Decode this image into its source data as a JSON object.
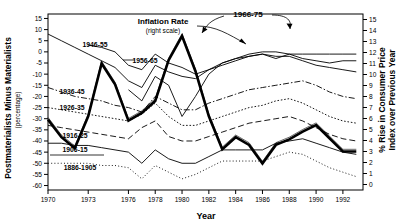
{
  "chart_data": {
    "type": "line",
    "title": "",
    "xlabel": "Year",
    "ylabel": "Postmaterialists Minus Materialists (percentage)",
    "ylabel_sub": "(percentage)",
    "y2label": "% Rise in Consumer Price Index over Previous Year",
    "grid": false,
    "legend_position": "inline-annotations",
    "xlim": [
      1970,
      1993.5
    ],
    "ylim": [
      -62,
      17
    ],
    "y2lim": [
      15.5,
      -0.5
    ],
    "x_ticks": [
      1970,
      1973,
      1976,
      1978,
      1980,
      1982,
      1984,
      1986,
      1988,
      1990,
      1992
    ],
    "x_tick_labels": [
      "1970",
      "1973",
      "1976",
      "1978",
      "1980",
      "1982",
      "1984",
      "1986",
      "1988",
      "1990",
      "1992"
    ],
    "y_ticks": [
      15,
      10,
      5,
      0,
      -5,
      -10,
      -15,
      -20,
      -25,
      -30,
      -35,
      -40,
      -45,
      -50,
      -55,
      -60
    ],
    "y_tick_labels": [
      "15",
      "10",
      "5",
      "0",
      "-5",
      "-10",
      "-15",
      "-20",
      "-25",
      "-30",
      "-35",
      "-40",
      "-45",
      "-50",
      "-55",
      "-60"
    ],
    "y2_ticks": [
      0,
      1,
      2,
      3,
      4,
      5,
      6,
      7,
      8,
      9,
      10,
      11,
      12,
      13,
      14,
      15
    ],
    "y2_tick_labels": [
      "0",
      "1",
      "2",
      "3",
      "4",
      "5",
      "6",
      "7",
      "8",
      "9",
      "10",
      "11",
      "12",
      "13",
      "14",
      "15"
    ],
    "x": [
      1970,
      1971,
      1972,
      1973,
      1974,
      1975,
      1976,
      1977,
      1978,
      1979,
      1980,
      1981,
      1982,
      1983,
      1984,
      1985,
      1986,
      1987,
      1988,
      1989,
      1990,
      1991,
      1992,
      1993
    ],
    "series": [
      {
        "name": "1966-75",
        "label": "1966-75",
        "style": "solid-thin",
        "axis": "left",
        "values": [
          null,
          null,
          null,
          null,
          null,
          null,
          -17,
          -22,
          -11,
          -15,
          -29,
          -20,
          -10,
          -5,
          -3,
          -1,
          0,
          0,
          -1,
          -1,
          -1,
          -1,
          -1,
          -1
        ]
      },
      {
        "name": "1946-55",
        "label": "1946-55",
        "style": "solid-thin",
        "axis": "left",
        "values": [
          8,
          5,
          2,
          -1,
          -4,
          -7,
          -13,
          -16,
          -6,
          -9,
          -11,
          -12,
          -8,
          -6,
          -4,
          -2,
          -1,
          -3,
          -1,
          -3,
          -4,
          -5,
          -4,
          -4
        ]
      },
      {
        "name": "1956-65",
        "label": "1956-65",
        "style": "solid-thin",
        "axis": "left",
        "values": [
          null,
          null,
          null,
          3,
          2,
          0,
          -6,
          -8,
          -1,
          -5,
          -7,
          -10,
          -8,
          -5,
          -3,
          -2,
          -1,
          -2,
          -2,
          -4,
          -6,
          -7,
          -8,
          -9
        ]
      },
      {
        "name": "1936-45",
        "label": "1936-45",
        "style": "dashdot",
        "axis": "left",
        "values": [
          -16,
          -18,
          -20,
          -21,
          -22,
          -24,
          -25,
          -27,
          -20,
          -23,
          -26,
          -26,
          -23,
          -21,
          -19,
          -17,
          -16,
          -15,
          -14,
          -13,
          -15,
          -18,
          -20,
          -21
        ]
      },
      {
        "name": "1926-35",
        "label": "1926-35",
        "style": "dotted",
        "axis": "left",
        "values": [
          -25,
          -26,
          -27,
          -28,
          -29,
          -30,
          -31,
          -28,
          -23,
          -29,
          -33,
          -33,
          -31,
          -29,
          -27,
          -25,
          -24,
          -22,
          -21,
          -23,
          -26,
          -29,
          -31,
          -32
        ]
      },
      {
        "name": "1916-25",
        "label": "1916-25",
        "style": "dashed",
        "axis": "left",
        "values": [
          -33,
          -34,
          -35,
          -36,
          -37,
          -38,
          -39,
          -34,
          -31,
          -38,
          -40,
          -40,
          -38,
          -36,
          -34,
          -32,
          -31,
          -30,
          -29,
          -31,
          -34,
          -37,
          -39,
          -40
        ]
      },
      {
        "name": "1906-15",
        "label": "1906-15",
        "style": "solid-thin",
        "axis": "left",
        "values": [
          -41,
          -41,
          -42,
          -42,
          -43,
          -44,
          -45,
          -50,
          -44,
          -48,
          -50,
          -50,
          -47,
          -44,
          -44,
          -44,
          -44,
          -41,
          -40,
          -39,
          -41,
          -43,
          -45,
          -46
        ]
      },
      {
        "name": "1886-1905",
        "label": "1886-1905",
        "style": "fine-dotted",
        "axis": "left",
        "values": [
          -50,
          -50,
          -50,
          -50,
          -51,
          -51,
          -52,
          -57,
          -51,
          -54,
          -57,
          -55,
          -52,
          -49,
          -49,
          -49,
          -49,
          -47,
          -45,
          -46,
          -49,
          -52,
          -54,
          -56
        ]
      },
      {
        "name": "Inflation Rate",
        "label": "Inflation Rate",
        "sublabel": "(right scale)",
        "style": "thick",
        "axis": "right",
        "values": [
          5.9,
          4.3,
          3.3,
          6.2,
          11.0,
          9.1,
          5.8,
          6.5,
          7.6,
          11.3,
          13.5,
          10.3,
          6.2,
          3.2,
          4.3,
          3.6,
          1.9,
          3.6,
          4.1,
          4.8,
          5.4,
          4.2,
          3.0,
          3.0
        ]
      }
    ],
    "annotations": [
      {
        "name": "inflation-rate-annotation",
        "text": "Inflation Rate",
        "sub": "(right scale)"
      },
      {
        "name": "cohort-1966-75-annotation",
        "text": "1966-75"
      }
    ]
  }
}
